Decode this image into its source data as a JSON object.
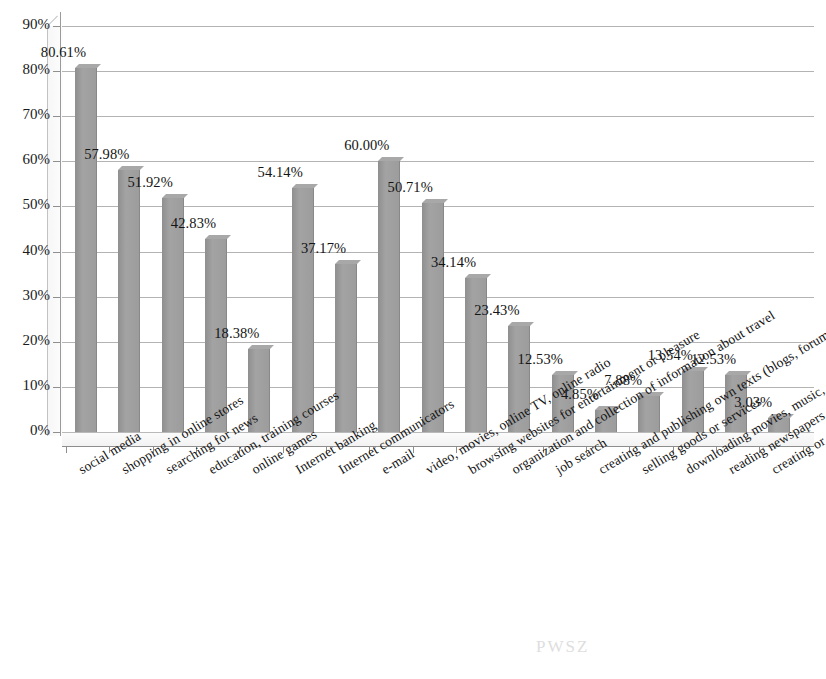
{
  "chart_data": {
    "type": "bar",
    "title": "",
    "subtitle": "",
    "xlabel": "",
    "ylabel": "",
    "ylim": [
      0,
      90
    ],
    "ytick_labels": [
      "0%",
      "10%",
      "20%",
      "30%",
      "40%",
      "50%",
      "60%",
      "70%",
      "80%",
      "90%"
    ],
    "ytick_values": [
      0,
      10,
      20,
      30,
      40,
      50,
      60,
      70,
      80,
      90
    ],
    "grid": true,
    "legend": false,
    "legend_position": "none",
    "bar_color": "#9a9a9a",
    "value_suffix": "%",
    "categories": [
      "social media",
      "shopping in online stores",
      "searching for news",
      "education, training courses",
      "online games",
      "Internet banking",
      "Internet communicators",
      "e-mail",
      "video, movies, online TV, online radio",
      "browsing websites for entertainment or pleasure",
      "organization and collection of information about travel",
      "job search",
      "creating and publishing own texts (blogs, forums...)",
      "selling goods or services",
      "downloading movies, music, software",
      "reading newspapers or books via the Internet",
      "creating or modifying websites"
    ],
    "values": [
      80.61,
      57.98,
      51.92,
      42.83,
      18.38,
      54.14,
      37.17,
      60.0,
      50.71,
      34.14,
      23.43,
      12.53,
      4.85,
      7.88,
      13.54,
      12.53,
      3.03
    ],
    "data_labels": [
      "80.61%",
      "57.98%",
      "51.92%",
      "42.83%",
      "18.38%",
      "54.14%",
      "37.17%",
      "60.00%",
      "50.71%",
      "34.14%",
      "23.43%",
      "12.53%",
      "4.85%",
      "7.88%",
      "13.54%",
      "12.53%",
      "3.03%"
    ]
  },
  "artifact_text": "PWSZ"
}
